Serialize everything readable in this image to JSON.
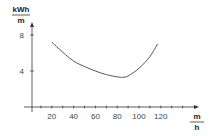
{
  "chart_data": {
    "type": "line",
    "title": "",
    "xlabel": {
      "numerator": "m",
      "denominator": "h"
    },
    "ylabel": {
      "numerator": "kWh",
      "denominator": "m"
    },
    "xlim": [
      0,
      155
    ],
    "ylim": [
      0,
      10
    ],
    "x_ticks": [
      20,
      40,
      60,
      80,
      100,
      120
    ],
    "x_minor_step": 10,
    "y_ticks": [
      4,
      8
    ],
    "grid": false,
    "legend": null,
    "series": [
      {
        "name": "energy per distance",
        "x": [
          20,
          30,
          40,
          50,
          60,
          70,
          80,
          85,
          90,
          100,
          110,
          117
        ],
        "y": [
          7.2,
          6.1,
          5.1,
          4.5,
          4.0,
          3.6,
          3.35,
          3.3,
          3.45,
          4.3,
          5.6,
          7.0
        ]
      }
    ],
    "colors": {
      "axis": "#333333",
      "line": "#555555"
    }
  }
}
